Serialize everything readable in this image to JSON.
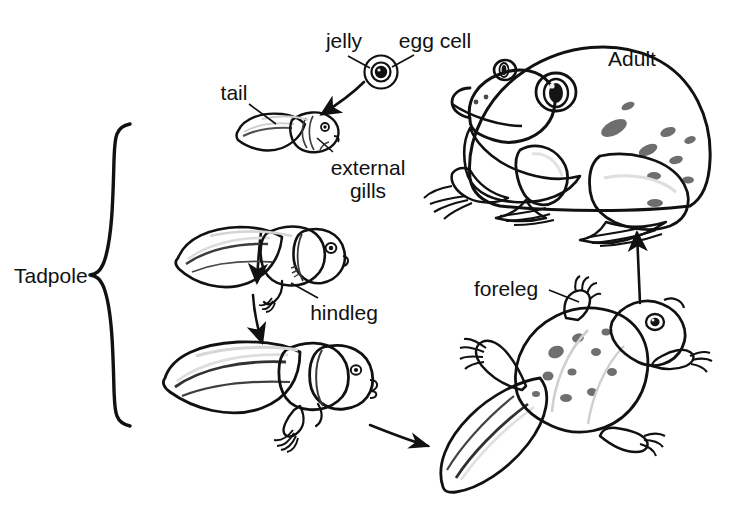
{
  "figure": {
    "background_color": "#ffffff",
    "ink_color": "#111111"
  },
  "labels": {
    "jelly": "jelly",
    "egg_cell": "egg cell",
    "tail": "tail",
    "external_gills_line1": "external",
    "external_gills_line2": "gills",
    "hindleg": "hindleg",
    "tadpole": "Tadpole",
    "foreleg": "foreleg",
    "adult": "Adult"
  },
  "stages": [
    {
      "id": "egg",
      "name": "egg",
      "parts": [
        "jelly",
        "egg cell"
      ]
    },
    {
      "id": "tadpole-early",
      "name": "early tadpole",
      "parts": [
        "tail",
        "external gills"
      ]
    },
    {
      "id": "tadpole-hindlegs",
      "name": "tadpole with hindlegs",
      "parts": [
        "hindleg"
      ]
    },
    {
      "id": "tadpole-late",
      "name": "late tadpole",
      "parts": [
        "hindleg",
        "tail"
      ]
    },
    {
      "id": "froglet",
      "name": "froglet",
      "parts": [
        "foreleg",
        "tail"
      ]
    },
    {
      "id": "adult-frog",
      "name": "adult frog",
      "parts": []
    }
  ],
  "palette": {
    "body_mid": "#8f8f8f",
    "body_light": "#b4b4b4",
    "body_dark": "#6e6e6e",
    "body_shadow": "#5a5a5a",
    "highlight": "#d8d8d8",
    "outline": "#111111",
    "egg_cell_fill": "#101010"
  },
  "arrows": [
    {
      "id": "egg-to-tadpole",
      "from": "egg",
      "to": "tadpole-early",
      "direction": "down-left"
    },
    {
      "id": "tadpole-early-to-hindlegs",
      "from": "tadpole-early",
      "to": "tadpole-hindlegs",
      "direction": "down"
    },
    {
      "id": "hindlegs-to-late",
      "from": "tadpole-hindlegs",
      "to": "tadpole-late",
      "direction": "down"
    },
    {
      "id": "late-to-froglet",
      "from": "tadpole-late",
      "to": "froglet",
      "direction": "right"
    },
    {
      "id": "froglet-to-adult",
      "from": "froglet",
      "to": "adult-frog",
      "direction": "up"
    }
  ],
  "bracket": {
    "label": "Tadpole",
    "groups": [
      "tadpole-early",
      "tadpole-hindlegs",
      "tadpole-late"
    ]
  }
}
